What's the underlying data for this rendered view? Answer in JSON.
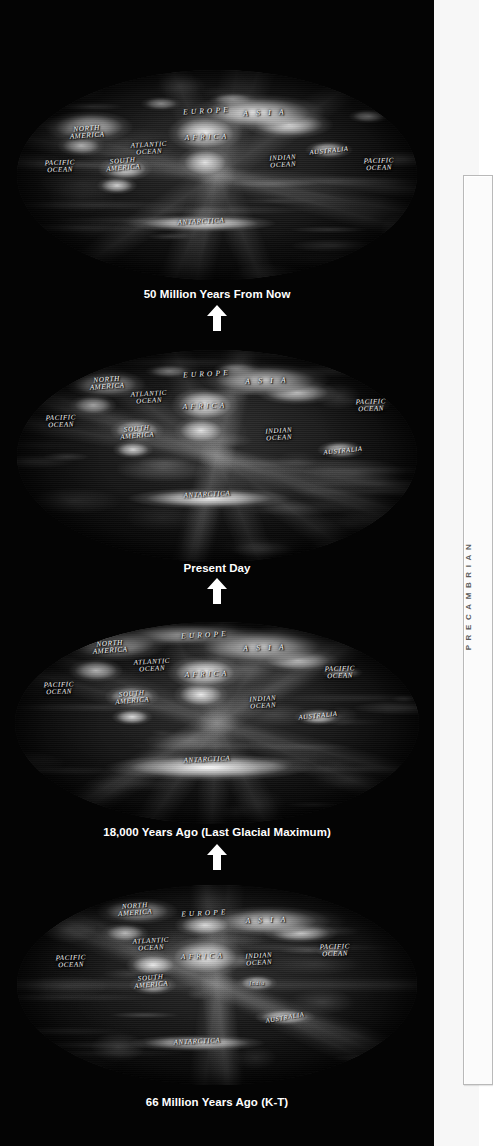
{
  "page": {
    "background_color": "#040404",
    "margin_color": "#f7f7f7"
  },
  "margin": {
    "era_label": "PRECAMBRIAN",
    "era_label_color": "#5a5a5a"
  },
  "arrow": {
    "name": "up-arrow-icon",
    "color": "#ffffff",
    "direction": "up"
  },
  "maps": [
    {
      "id": "map-future",
      "caption": "50 Million Years From Now",
      "labels": [
        {
          "text": "NORTH\nAMERICA",
          "x": 17.5,
          "y": 30.0,
          "size": 7.2,
          "rot": -4
        },
        {
          "text": "EUROPE",
          "x": 47.5,
          "y": 19.5,
          "size": 7.4,
          "rot": -3,
          "wide": true
        },
        {
          "text": "A S I A",
          "x": 62.0,
          "y": 20.5,
          "size": 7.6,
          "rot": -2,
          "wide": true
        },
        {
          "text": "AFRICA",
          "x": 47.5,
          "y": 32.0,
          "size": 7.4,
          "rot": -2,
          "wide": true
        },
        {
          "text": "ATLANTIC\nOCEAN",
          "x": 33.0,
          "y": 37.5,
          "size": 7.0,
          "rot": -3
        },
        {
          "text": "SOUTH\nAMERICA",
          "x": 26.5,
          "y": 45.0,
          "size": 7.0,
          "rot": -5
        },
        {
          "text": "PACIFIC\nOCEAN",
          "x": 10.8,
          "y": 46.0,
          "size": 7.0,
          "rot": -2
        },
        {
          "text": "PACIFIC\nOCEAN",
          "x": 90.5,
          "y": 45.0,
          "size": 7.0,
          "rot": -2
        },
        {
          "text": "INDIAN\nOCEAN",
          "x": 66.5,
          "y": 44.0,
          "size": 7.0,
          "rot": -3
        },
        {
          "text": "AUSTRALIA",
          "x": 78.0,
          "y": 38.5,
          "size": 6.6,
          "rot": -6
        },
        {
          "text": "ANTARCTICA",
          "x": 46.0,
          "y": 72.5,
          "size": 7.0,
          "rot": -3
        }
      ]
    },
    {
      "id": "map-present",
      "caption": "Present Day",
      "labels": [
        {
          "text": "NORTH\nAMERICA",
          "x": 22.5,
          "y": 16.0,
          "size": 7.2,
          "rot": -4
        },
        {
          "text": "EUROPE",
          "x": 47.5,
          "y": 11.5,
          "size": 7.4,
          "rot": -3,
          "wide": true
        },
        {
          "text": "A S I A",
          "x": 62.5,
          "y": 14.5,
          "size": 7.6,
          "rot": -2,
          "wide": true
        },
        {
          "text": "AFRICA",
          "x": 47.0,
          "y": 26.5,
          "size": 7.4,
          "rot": -2,
          "wide": true
        },
        {
          "text": "ATLANTIC\nOCEAN",
          "x": 33.0,
          "y": 22.5,
          "size": 7.0,
          "rot": -3
        },
        {
          "text": "SOUTH\nAMERICA",
          "x": 30.0,
          "y": 39.0,
          "size": 7.0,
          "rot": -5
        },
        {
          "text": "PACIFIC\nOCEAN",
          "x": 11.0,
          "y": 34.0,
          "size": 7.0,
          "rot": -2
        },
        {
          "text": "PACIFIC\nOCEAN",
          "x": 88.5,
          "y": 26.5,
          "size": 7.0,
          "rot": -2
        },
        {
          "text": "INDIAN\nOCEAN",
          "x": 65.5,
          "y": 40.0,
          "size": 7.0,
          "rot": -3
        },
        {
          "text": "AUSTRALIA",
          "x": 81.5,
          "y": 47.5,
          "size": 6.6,
          "rot": -6
        },
        {
          "text": "ANTARCTICA",
          "x": 47.5,
          "y": 68.5,
          "size": 7.0,
          "rot": -3
        }
      ]
    },
    {
      "id": "map-lgm",
      "caption": "18,000 Years Ago (Last Glacial Maximum)",
      "labels": [
        {
          "text": "NORTH\nAMERICA",
          "x": 23.5,
          "y": 13.0,
          "size": 7.2,
          "rot": -4
        },
        {
          "text": "EUROPE",
          "x": 47.0,
          "y": 6.5,
          "size": 7.4,
          "rot": -3,
          "wide": true
        },
        {
          "text": "A S I A",
          "x": 62.0,
          "y": 13.0,
          "size": 7.6,
          "rot": -2,
          "wide": true
        },
        {
          "text": "AFRICA",
          "x": 47.5,
          "y": 25.5,
          "size": 7.4,
          "rot": -2,
          "wide": true
        },
        {
          "text": "ATLANTIC\nOCEAN",
          "x": 34.0,
          "y": 22.0,
          "size": 7.0,
          "rot": -3
        },
        {
          "text": "SOUTH\nAMERICA",
          "x": 29.0,
          "y": 37.5,
          "size": 7.0,
          "rot": -5
        },
        {
          "text": "PACIFIC\nOCEAN",
          "x": 11.0,
          "y": 33.0,
          "size": 7.0,
          "rot": -2
        },
        {
          "text": "PACIFIC\nOCEAN",
          "x": 80.5,
          "y": 25.0,
          "size": 7.0,
          "rot": -2
        },
        {
          "text": "INDIAN\nOCEAN",
          "x": 61.5,
          "y": 40.0,
          "size": 7.0,
          "rot": -3
        },
        {
          "text": "AUSTRALIA",
          "x": 75.0,
          "y": 46.5,
          "size": 6.6,
          "rot": -6
        },
        {
          "text": "ANTARCTICA",
          "x": 47.5,
          "y": 68.5,
          "size": 7.0,
          "rot": -3
        }
      ]
    },
    {
      "id": "map-kt",
      "caption": "66 Million Years Ago (K-T)",
      "labels": [
        {
          "text": "NORTH\nAMERICA",
          "x": 29.5,
          "y": 12.5,
          "size": 7.0,
          "rot": -4
        },
        {
          "text": "EUROPE",
          "x": 47.0,
          "y": 14.5,
          "size": 7.2,
          "rot": -3,
          "wide": true
        },
        {
          "text": "A S I A",
          "x": 62.5,
          "y": 17.5,
          "size": 7.4,
          "rot": -2,
          "wide": true
        },
        {
          "text": "AFRICA",
          "x": 46.5,
          "y": 36.0,
          "size": 7.2,
          "rot": -2,
          "wide": true
        },
        {
          "text": "ATLANTIC\nOCEAN",
          "x": 33.5,
          "y": 30.0,
          "size": 7.0,
          "rot": -3
        },
        {
          "text": "SOUTH\nAMERICA",
          "x": 33.5,
          "y": 48.5,
          "size": 7.0,
          "rot": -5
        },
        {
          "text": "PACIFIC\nOCEAN",
          "x": 13.5,
          "y": 38.5,
          "size": 7.0,
          "rot": -2
        },
        {
          "text": "PACIFIC\nOCEAN",
          "x": 79.5,
          "y": 33.0,
          "size": 7.0,
          "rot": -2
        },
        {
          "text": "INDIAN\nOCEAN",
          "x": 60.5,
          "y": 37.5,
          "size": 7.0,
          "rot": -3
        },
        {
          "text": "India",
          "x": 60.0,
          "y": 49.0,
          "size": 6.0,
          "rot": -2,
          "dark": true
        },
        {
          "text": "AUSTRALIA",
          "x": 67.0,
          "y": 66.5,
          "size": 6.6,
          "rot": -10
        },
        {
          "text": "ANTARCTICA",
          "x": 45.0,
          "y": 78.5,
          "size": 7.0,
          "rot": -3
        }
      ]
    }
  ]
}
